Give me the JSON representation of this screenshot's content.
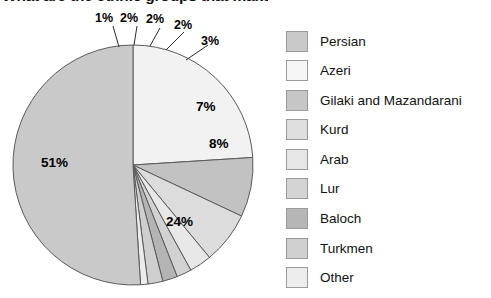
{
  "title": {
    "text": "What are the ethnic groups that make up the population?",
    "clipped": true
  },
  "chart_data": {
    "type": "pie",
    "title": "What are the ethnic groups that make up the population?",
    "categories": [
      "Persian",
      "Azeri",
      "Gilaki and Mazandarani",
      "Kurd",
      "Arab",
      "Lur",
      "Baloch",
      "Turkmen",
      "Other"
    ],
    "values": [
      51,
      24,
      8,
      7,
      3,
      2,
      2,
      2,
      1
    ],
    "value_labels": [
      "51%",
      "24%",
      "8%",
      "7%",
      "3%",
      "2%",
      "2%",
      "2%",
      "1%"
    ],
    "colors": [
      "#c9c9c9",
      "#f2f2f2",
      "#c2c2c2",
      "#dcdcdc",
      "#e8e8e8",
      "#d2d2d2",
      "#b4b4b4",
      "#cfcfcf",
      "#ececec"
    ],
    "legend_position": "right",
    "grid": false,
    "start_angle_deg": 0,
    "direction": "clockwise"
  },
  "pie": {
    "slices": [
      {
        "label": "Persian",
        "value": 51,
        "value_label": "51%",
        "color": "#c9c9c9",
        "label_x": 41,
        "label_y": 155,
        "size": "lg"
      },
      {
        "label": "Azeri",
        "value": 24,
        "value_label": "24%",
        "color": "#f2f2f2",
        "label_x": 166,
        "label_y": 214,
        "size": "lg"
      },
      {
        "label": "Gilaki and Mazandarani",
        "value": 8,
        "value_label": "8%",
        "color": "#c2c2c2",
        "label_x": 209,
        "label_y": 136,
        "size": "lg"
      },
      {
        "label": "Kurd",
        "value": 7,
        "value_label": "7%",
        "color": "#dcdcdc",
        "label_x": 196,
        "label_y": 99,
        "size": "lg"
      },
      {
        "label": "Arab",
        "value": 3,
        "value_label": "3%",
        "color": "#e8e8e8",
        "label_x": 201,
        "label_y": 34,
        "size": "sm"
      },
      {
        "label": "Lur",
        "value": 2,
        "value_label": "2%",
        "color": "#d2d2d2",
        "label_x": 174,
        "label_y": 18,
        "size": "sm"
      },
      {
        "label": "Baloch",
        "value": 2,
        "value_label": "2%",
        "color": "#b4b4b4",
        "label_x": 146,
        "label_y": 12,
        "size": "sm"
      },
      {
        "label": "Turkmen",
        "value": 2,
        "value_label": "2%",
        "color": "#cfcfcf",
        "label_x": 120,
        "label_y": 11,
        "size": "sm"
      },
      {
        "label": "Other",
        "value": 1,
        "value_label": "1%",
        "color": "#ececec",
        "label_x": 95,
        "label_y": 11,
        "size": "sm"
      }
    ],
    "leader_lines": [
      {
        "x1": 113,
        "y1": 26,
        "x2": 119,
        "y2": 47
      },
      {
        "x1": 137,
        "y1": 26,
        "x2": 134,
        "y2": 45
      },
      {
        "x1": 160,
        "y1": 28,
        "x2": 150,
        "y2": 46
      },
      {
        "x1": 184,
        "y1": 32,
        "x2": 166,
        "y2": 50
      },
      {
        "x1": 208,
        "y1": 45,
        "x2": 186,
        "y2": 60
      }
    ]
  },
  "legend": {
    "items": [
      {
        "label": "Persian",
        "color": "#c9c9c9"
      },
      {
        "label": "Azeri",
        "color": "#f6f6f6"
      },
      {
        "label": "Gilaki and Mazandarani",
        "color": "#c6c6c6"
      },
      {
        "label": "Kurd",
        "color": "#dedede"
      },
      {
        "label": "Arab",
        "color": "#e6e6e6"
      },
      {
        "label": "Lur",
        "color": "#d4d4d4"
      },
      {
        "label": "Baloch",
        "color": "#b6b6b6"
      },
      {
        "label": "Turkmen",
        "color": "#d0d0d0"
      },
      {
        "label": "Other",
        "color": "#ededed"
      }
    ]
  }
}
